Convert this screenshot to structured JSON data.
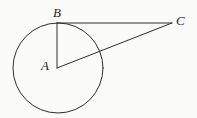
{
  "figure": {
    "kind": "geometry-diagram",
    "width": 197,
    "height": 118,
    "background_color": "#fbfbfa",
    "stroke_color": "#2e2e2e",
    "stroke_width": 1,
    "label_color": "#1f1f1f"
  },
  "points": [
    {
      "id": "A",
      "label": "A",
      "x": 57,
      "y": 68,
      "role": "circle-center",
      "label_x": 41,
      "label_y": 59
    },
    {
      "id": "B",
      "label": "B",
      "x": 57,
      "y": 23,
      "role": "tangent-point-on-circle",
      "label_x": 53,
      "label_y": 6
    },
    {
      "id": "C",
      "label": "C",
      "x": 172,
      "y": 23,
      "role": "external-point",
      "label_x": 176,
      "label_y": 14
    }
  ],
  "circle": {
    "id": "circle-A",
    "center_x": 58,
    "center_y": 68,
    "radius": 45
  },
  "segments": [
    {
      "id": "AB",
      "label": "AB",
      "x1": 57,
      "y1": 68,
      "x2": 57,
      "y2": 23,
      "role": "radius"
    },
    {
      "id": "BC",
      "label": "BC",
      "x1": 57,
      "y1": 23,
      "x2": 172,
      "y2": 23,
      "role": "tangent"
    },
    {
      "id": "AC",
      "label": "AC",
      "x1": 57,
      "y1": 68,
      "x2": 172,
      "y2": 23,
      "role": "hypotenuse"
    }
  ]
}
